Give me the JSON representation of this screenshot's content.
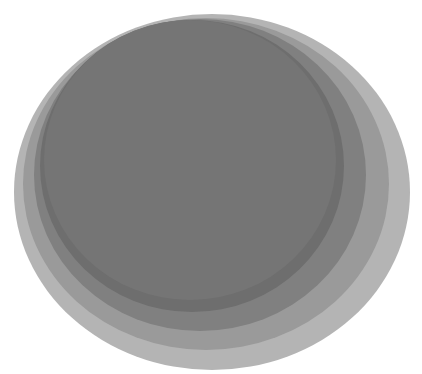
{
  "image": {
    "description": "Overlapping offset gray discs with graded tones, darkest in the upper-left, lightest halo toward the lower-right",
    "width": 422,
    "height": 374,
    "background": "#ffffff"
  },
  "discs": [
    {
      "name": "outer-halo-disc",
      "cx": 212,
      "cy": 192,
      "rx": 198,
      "ry": 178,
      "color": "#b4b4b4"
    },
    {
      "name": "second-ring-disc",
      "cx": 206,
      "cy": 184,
      "rx": 183,
      "ry": 166,
      "color": "#9a9a9a"
    },
    {
      "name": "third-ring-disc",
      "cx": 200,
      "cy": 175,
      "rx": 166,
      "ry": 156,
      "color": "#808080"
    },
    {
      "name": "inner-core-disc",
      "cx": 192,
      "cy": 166,
      "rx": 152,
      "ry": 146,
      "color": "#6e6e6e"
    },
    {
      "name": "core-rim-disc",
      "cx": 190,
      "cy": 160,
      "rx": 146,
      "ry": 140,
      "color": "#757575"
    }
  ]
}
